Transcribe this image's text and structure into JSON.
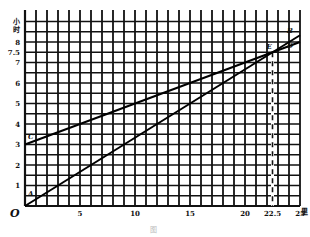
{
  "chart_data": {
    "type": "line",
    "title": "",
    "xlabel": "里",
    "ylabel": "小时",
    "origin_label": "O",
    "xlim": [
      0,
      25
    ],
    "ylim": [
      0,
      9
    ],
    "grid": true,
    "grid_x_step": 1,
    "grid_y_step": 0.5,
    "x_ticks": [
      5,
      10,
      15,
      20,
      22.5,
      25
    ],
    "x_tick_labels": [
      "5",
      "10",
      "15",
      "20",
      "22.5",
      "25"
    ],
    "y_ticks": [
      1,
      2,
      3,
      4,
      5,
      6,
      7,
      7.5,
      8
    ],
    "y_tick_labels": [
      "1",
      "2",
      "3",
      "4",
      "5",
      "6",
      "7",
      "7.5",
      "8"
    ],
    "series": [
      {
        "name": "AB",
        "start_label": "A",
        "end_label": "B",
        "points": [
          [
            0,
            0
          ],
          [
            25,
            8.33
          ]
        ]
      },
      {
        "name": "CD",
        "start_label": "C",
        "end_label": "D",
        "points": [
          [
            0,
            3
          ],
          [
            25,
            8
          ]
        ]
      }
    ],
    "annotations": [
      {
        "type": "dashed-vertical",
        "x": 22.5,
        "y_range": [
          0,
          7.5
        ]
      },
      {
        "type": "point-label",
        "text": "E",
        "at": [
          22.5,
          7.5
        ]
      }
    ],
    "caption": "图"
  }
}
